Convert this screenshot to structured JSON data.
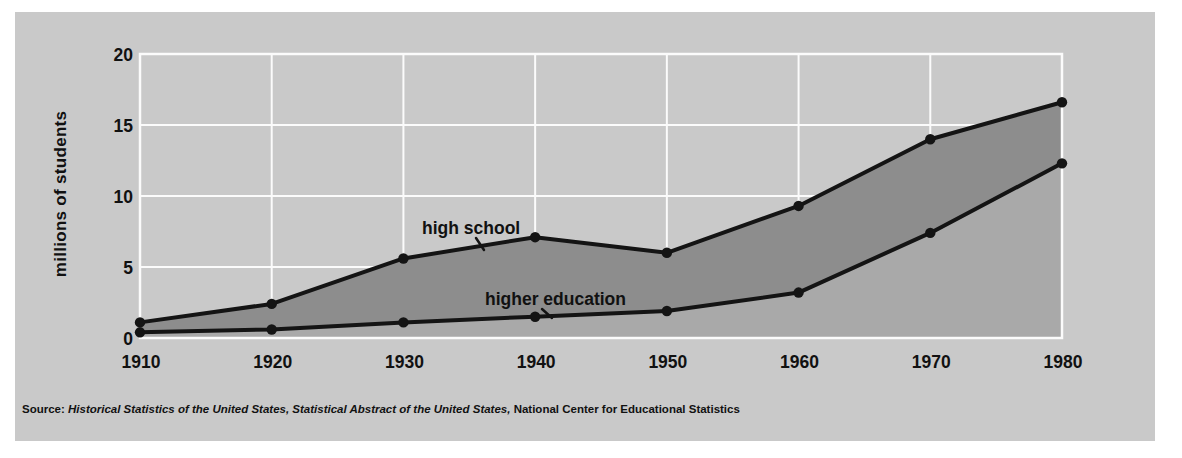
{
  "colors": {
    "page_bg": "#ffffff",
    "panel_bg": "#c9c9c9",
    "fill_dark": "#8d8d8d",
    "fill_medium": "#a9a9a9",
    "line": "#141414",
    "grid": "#fbfbfb",
    "text": "#111111"
  },
  "y_axis_title": "millions of students",
  "labels": {
    "high_school": "high school",
    "higher_education": "higher education"
  },
  "source": {
    "prefix": "Source: ",
    "italic_titles": "Historical Statistics of the United States, Statistical Abstract of the United States,",
    "rest": " National Center for Educational Statistics"
  },
  "chart_data": {
    "type": "area",
    "categories": [
      "1910",
      "1920",
      "1930",
      "1940",
      "1950",
      "1960",
      "1970",
      "1980"
    ],
    "series": [
      {
        "name": "high-school",
        "label": "high school",
        "values": [
          1.1,
          2.4,
          5.6,
          7.1,
          6.0,
          9.3,
          14.0,
          16.6
        ]
      },
      {
        "name": "higher-education",
        "label": "higher education",
        "values": [
          0.4,
          0.6,
          1.1,
          1.5,
          1.9,
          3.2,
          7.4,
          12.3
        ]
      }
    ],
    "title": "",
    "xlabel": "",
    "ylabel": "millions of students",
    "ylim": [
      0,
      20
    ],
    "yticks": [
      0,
      5,
      10,
      15,
      20
    ],
    "grid": true,
    "legend_position": "inline-annotations",
    "layout": {
      "plot": {
        "left": 125,
        "top": 42,
        "right": 1047,
        "bottom": 326
      },
      "leaders": [
        {
          "x1": 461,
          "y1": 226,
          "x2": 469,
          "y2": 238
        },
        {
          "x1": 527,
          "y1": 297,
          "x2": 537,
          "y2": 306
        }
      ]
    }
  }
}
